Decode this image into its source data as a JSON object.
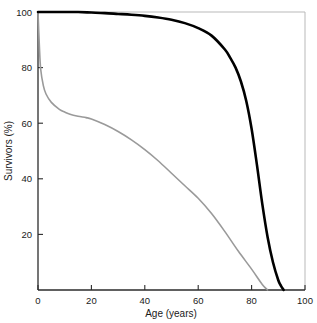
{
  "chart_data": {
    "type": "line",
    "title": "",
    "subtitle": "",
    "xlabel": "Age (years)",
    "ylabel": "Survivors (%)",
    "xlim": [
      0,
      100
    ],
    "ylim": [
      0,
      100
    ],
    "xticks": [
      0,
      20,
      40,
      60,
      80,
      100
    ],
    "yticks": [
      20,
      40,
      60,
      80,
      100
    ],
    "xtick_labels": [
      "0",
      "20",
      "40",
      "60",
      "80",
      "100"
    ],
    "ytick_labels": [
      "20",
      "40",
      "60",
      "80",
      "100"
    ],
    "grid": false,
    "legend": null,
    "legend_position": "none",
    "annotations": [],
    "series": [
      {
        "name": "rectangular-survival-curve",
        "color": "#000000",
        "line_width": 2.6,
        "x": [
          0,
          1,
          2,
          5,
          10,
          15,
          20,
          25,
          30,
          35,
          40,
          45,
          50,
          55,
          60,
          65,
          70,
          72,
          74,
          76,
          78,
          80,
          82,
          84,
          86,
          88,
          90,
          91,
          92
        ],
        "values": [
          100,
          100,
          100,
          100,
          100,
          100,
          99.8,
          99.6,
          99.3,
          99.0,
          98.6,
          98.0,
          97.2,
          96.0,
          94.2,
          91.5,
          86.5,
          83.5,
          80.0,
          75.0,
          68.0,
          58.0,
          45.0,
          31.0,
          19.0,
          10.0,
          3.5,
          1.5,
          0
        ]
      },
      {
        "name": "historical-survival-curve",
        "color": "#9a9a9a",
        "line_width": 1.6,
        "x": [
          0,
          0.5,
          1,
          2,
          3,
          5,
          8,
          10,
          12,
          15,
          18,
          20,
          25,
          30,
          35,
          40,
          45,
          50,
          55,
          60,
          65,
          70,
          75,
          80,
          84,
          86
        ],
        "values": [
          100,
          88,
          79.5,
          73.5,
          70.5,
          67.5,
          65.0,
          64.0,
          63.2,
          62.5,
          62.0,
          61.5,
          59.5,
          57.0,
          54.0,
          50.5,
          46.5,
          42.0,
          37.5,
          33.0,
          27.5,
          21.0,
          14.0,
          7.5,
          2.0,
          0
        ]
      }
    ]
  },
  "axes": {
    "spine_color": "#2b2b2b",
    "tick_color": "#2b2b2b"
  }
}
